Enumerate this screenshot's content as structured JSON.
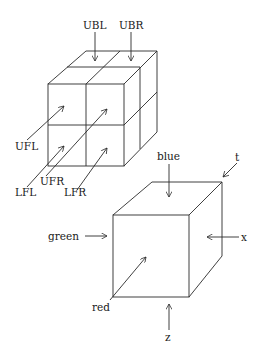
{
  "cube_2x2": {
    "labels": {
      "ubl": "UBL",
      "ubr": "UBR",
      "ufl": "UFL",
      "ufr": "UFR",
      "lfl": "LFL",
      "lfr": "LFR"
    }
  },
  "cube_single": {
    "labels": {
      "blue": "blue",
      "t": "t",
      "green": "green",
      "x": "x",
      "red": "red",
      "z": "z"
    }
  }
}
